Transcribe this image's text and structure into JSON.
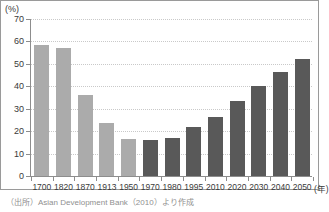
{
  "chart_data": {
    "type": "bar",
    "title": "",
    "subtitle": "",
    "xlabel": "(年)",
    "ylabel": "(%)",
    "ylim": [
      0,
      70
    ],
    "ytick_values": [
      0,
      10,
      20,
      30,
      40,
      50,
      60,
      70
    ],
    "ytick_labels": [
      "0",
      "10",
      "20",
      "30",
      "40",
      "50",
      "60",
      "70"
    ],
    "grid": true,
    "legend_position": "none",
    "categories": [
      "1700",
      "1820",
      "1870",
      "1913",
      "1950",
      "1970",
      "1980",
      "1995",
      "2010",
      "2020",
      "2030",
      "2040",
      "2050"
    ],
    "values": [
      58.5,
      57.0,
      36.0,
      23.5,
      16.5,
      16.0,
      17.0,
      22.0,
      26.5,
      33.5,
      40.0,
      46.5,
      52.0
    ],
    "series": [
      {
        "name": "Asia share of world GDP",
        "values": [
          58.5,
          57.0,
          36.0,
          23.5,
          16.5,
          16.0,
          17.0,
          22.0,
          26.5,
          33.5,
          40.0,
          46.5,
          52.0
        ]
      }
    ],
    "bar_colors": [
      "#ababab",
      "#ababab",
      "#ababab",
      "#ababab",
      "#ababab",
      "#595959",
      "#595959",
      "#595959",
      "#595959",
      "#595959",
      "#595959",
      "#595959",
      "#595959"
    ],
    "annotations": []
  },
  "colors": {
    "historical_bar": "#ababab",
    "projection_bar": "#595959",
    "axis": "#8d8d8d",
    "gridline": "#c9c9c9",
    "text": "#3a3a3a",
    "note_text": "#8f8f8f",
    "frame": "#9a9a9a",
    "background": "#ffffff"
  },
  "source_note": "（出所）Asian Development Bank（2010）より作成"
}
